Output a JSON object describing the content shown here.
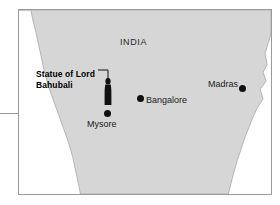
{
  "map": {
    "region_label": "INDIA",
    "land_color": "#d6d6d6",
    "land_outline_color": "#b4b4b4",
    "water_color": "#ffffff",
    "frame_color": "#9a9a9a",
    "marker_color": "#111111",
    "callout": {
      "line1": "Statue of Lord",
      "line2": "Bahubali"
    },
    "cities": [
      {
        "name": "Bangalore"
      },
      {
        "name": "Madras"
      },
      {
        "name": "Mysore"
      }
    ]
  }
}
